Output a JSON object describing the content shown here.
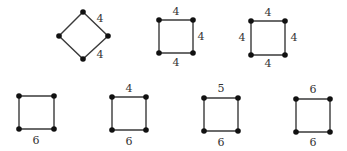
{
  "figure": {
    "shapes": [
      {
        "id": "diamond",
        "vertices": [
          [
            83,
            12
          ],
          [
            108,
            36
          ],
          [
            83,
            59
          ],
          [
            59,
            36
          ]
        ],
        "labels": [
          {
            "text": "4",
            "x": 100,
            "y": 19,
            "edge": "top-right"
          },
          {
            "text": "4",
            "x": 100,
            "y": 55,
            "edge": "bottom-right"
          }
        ]
      },
      {
        "id": "square-2",
        "vertices": [
          [
            159,
            20
          ],
          [
            193,
            20
          ],
          [
            193,
            53
          ],
          [
            159,
            53
          ]
        ],
        "labels": [
          {
            "text": "4",
            "x": 176,
            "y": 12,
            "edge": "top"
          },
          {
            "text": "4",
            "x": 201,
            "y": 37,
            "edge": "right"
          },
          {
            "text": "4",
            "x": 176,
            "y": 63,
            "edge": "bottom"
          }
        ]
      },
      {
        "id": "square-3",
        "vertices": [
          [
            251,
            21
          ],
          [
            285,
            21
          ],
          [
            285,
            55
          ],
          [
            251,
            55
          ]
        ],
        "labels": [
          {
            "text": "4",
            "x": 268,
            "y": 13,
            "edge": "top"
          },
          {
            "text": "4",
            "x": 242,
            "y": 38,
            "edge": "left"
          },
          {
            "text": "4",
            "x": 294,
            "y": 38,
            "edge": "right"
          },
          {
            "text": "4",
            "x": 268,
            "y": 64,
            "edge": "bottom"
          }
        ]
      },
      {
        "id": "square-4",
        "vertices": [
          [
            19,
            96
          ],
          [
            54,
            96
          ],
          [
            54,
            129
          ],
          [
            19,
            129
          ]
        ],
        "labels": [
          {
            "text": "6",
            "x": 36,
            "y": 141,
            "edge": "bottom"
          }
        ]
      },
      {
        "id": "square-5",
        "vertices": [
          [
            112,
            97
          ],
          [
            146,
            97
          ],
          [
            146,
            130
          ],
          [
            112,
            130
          ]
        ],
        "labels": [
          {
            "text": "4",
            "x": 129,
            "y": 89,
            "edge": "top"
          },
          {
            "text": "6",
            "x": 129,
            "y": 142,
            "edge": "bottom"
          }
        ]
      },
      {
        "id": "square-6",
        "vertices": [
          [
            204,
            98
          ],
          [
            238,
            98
          ],
          [
            238,
            131
          ],
          [
            204,
            131
          ]
        ],
        "labels": [
          {
            "text": "5",
            "x": 221,
            "y": 89,
            "edge": "top"
          },
          {
            "text": "6",
            "x": 221,
            "y": 143,
            "edge": "bottom"
          }
        ]
      },
      {
        "id": "square-7",
        "vertices": [
          [
            296,
            99
          ],
          [
            330,
            99
          ],
          [
            330,
            132
          ],
          [
            296,
            132
          ]
        ],
        "labels": [
          {
            "text": "6",
            "x": 313,
            "y": 90,
            "edge": "top"
          },
          {
            "text": "6",
            "x": 313,
            "y": 143,
            "edge": "bottom"
          }
        ]
      }
    ]
  }
}
